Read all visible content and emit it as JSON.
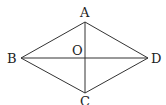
{
  "diagram": {
    "type": "rhombus-with-diagonals",
    "points": {
      "A": {
        "label": "A",
        "x": 85,
        "y": 22
      },
      "B": {
        "label": "B",
        "x": 21,
        "y": 58
      },
      "C": {
        "label": "C",
        "x": 85,
        "y": 93
      },
      "D": {
        "label": "D",
        "x": 148,
        "y": 58
      },
      "O": {
        "label": "O",
        "x": 85,
        "y": 58
      }
    },
    "segments": [
      "AB",
      "BC",
      "CD",
      "DA",
      "AC",
      "BD"
    ],
    "stroke_color": "#333333"
  }
}
